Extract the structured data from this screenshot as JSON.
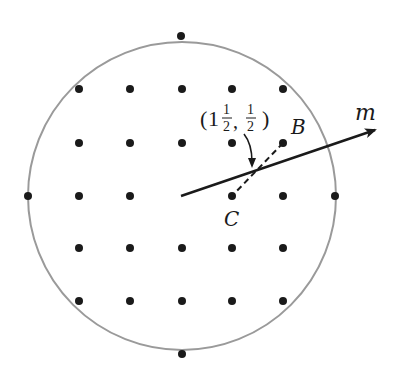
{
  "diagram": {
    "circle": {
      "cx": 182,
      "cy": 196,
      "r": 154,
      "stroke": "#9a9a9a"
    },
    "dot_color": "#1a1a1a",
    "grid": {
      "columns_x": [
        79,
        130,
        182,
        232,
        283
      ],
      "rows_y": [
        89,
        143,
        196,
        248,
        301
      ]
    },
    "extra_dots": [
      {
        "name": "top",
        "x": 181,
        "y": 36
      },
      {
        "name": "left",
        "x": 28,
        "y": 196
      },
      {
        "name": "right",
        "x": 335,
        "y": 196
      },
      {
        "name": "bottom",
        "x": 182,
        "y": 354
      }
    ],
    "line_m": {
      "x1": 181,
      "y1": 196,
      "x2": 375,
      "y2": 130,
      "label": "m"
    },
    "segment_BC": {
      "x1": 283,
      "y1": 143,
      "x2": 232,
      "y2": 196
    },
    "points": {
      "B": {
        "label": "B",
        "x": 283,
        "y": 143
      },
      "C": {
        "label": "C",
        "x": 232,
        "y": 196
      }
    },
    "annotation": {
      "text_open": "(1",
      "whole": "1",
      "frac1_num": "1",
      "frac1_den": "2",
      "comma": ",",
      "frac2_num": "1",
      "frac2_den": "2",
      "text_close": ")"
    }
  }
}
